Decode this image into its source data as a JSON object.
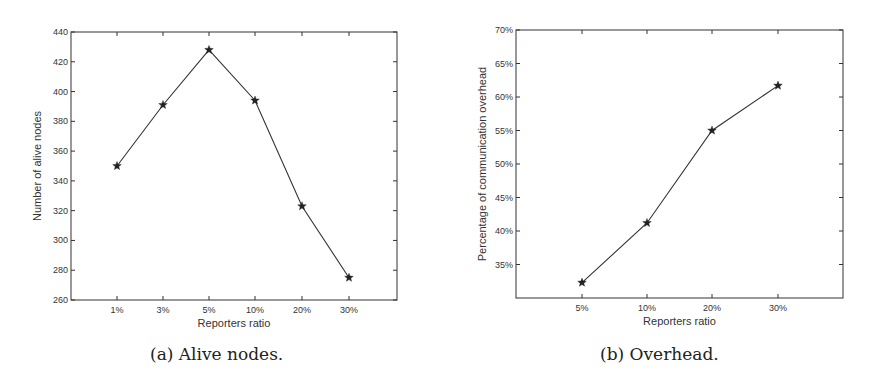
{
  "chart_data": [
    {
      "type": "line",
      "caption": "(a)  Alive nodes.",
      "title": "",
      "xlabel": "Reporters ratio",
      "ylabel": "Number of alive nodes",
      "categories": [
        "1%",
        "3%",
        "5%",
        "10%",
        "20%",
        "30%"
      ],
      "values": [
        350,
        391,
        428,
        394,
        323,
        275
      ],
      "ylim": [
        260,
        440
      ],
      "yticks": [
        260,
        280,
        300,
        320,
        340,
        360,
        380,
        400,
        420,
        440
      ],
      "marker": "star",
      "grid": false,
      "legend": null
    },
    {
      "type": "line",
      "caption": "(b)  Overhead.",
      "title": "",
      "xlabel": "Reporters ratio",
      "ylabel": "Percentage of communication overhead",
      "categories": [
        "5%",
        "10%",
        "20%",
        "30%"
      ],
      "values": [
        32.3,
        41.2,
        55.0,
        61.7
      ],
      "ylim": [
        30,
        70
      ],
      "yticks": [
        "35%",
        "40%",
        "45%",
        "50%",
        "55%",
        "60%",
        "65%",
        "70%"
      ],
      "marker": "star",
      "grid": false,
      "legend": null
    }
  ]
}
